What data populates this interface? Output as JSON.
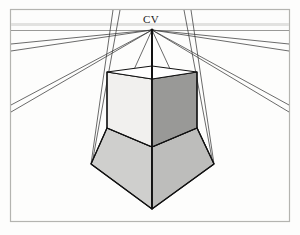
{
  "figure": {
    "title": "",
    "labels": {
      "center_of_vision": "CV"
    },
    "colors": {
      "background": "#fdfdfc",
      "frame_border": "#b4b4b0",
      "horizon_line": "#d8d8d6",
      "construction_line": "#3b3b3b",
      "object_edge": "#111111",
      "face_top": "#ffffff",
      "face_left_light": "#f0efed",
      "face_right_dark": "#9a9a98",
      "face_lower_left": "#cfcfcd",
      "face_lower_right": "#bfbfbd",
      "label_text": "#1a1a1a"
    },
    "geometry": {
      "frame": {
        "x": 10,
        "y": 9,
        "width": 280,
        "height": 213
      },
      "horizon_y": 30,
      "vanishing_point": {
        "x": 152,
        "y": 30
      },
      "cube_top": {
        "left": {
          "x": 107,
          "y": 72
        },
        "back": {
          "x": 152,
          "y": 66
        },
        "right": {
          "x": 197,
          "y": 72
        },
        "front": {
          "x": 152,
          "y": 79
        }
      },
      "cube_mid": {
        "left": {
          "x": 107,
          "y": 128
        },
        "center": {
          "x": 152,
          "y": 147
        },
        "right": {
          "x": 197,
          "y": 128
        }
      },
      "lower_block": {
        "left": {
          "x": 91,
          "y": 164
        },
        "center": {
          "x": 152,
          "y": 209
        },
        "right": {
          "x": 214,
          "y": 164
        }
      }
    },
    "construction_lines": {
      "description": "one-point perspective convergence lines to CV",
      "count": 14
    }
  }
}
